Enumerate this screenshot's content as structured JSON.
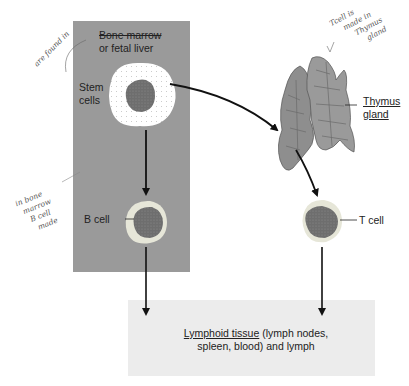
{
  "diagram": {
    "regions": {
      "marrow": {
        "label_line1": "Bone marrow",
        "label_line2": "or fetal liver"
      },
      "lymphoid": {
        "label_underlined": "Lymphoid tissue",
        "label_rest": " (lymph nodes,",
        "label_line2": "spleen, blood) and lymph"
      }
    },
    "labels": {
      "stem_line1": "Stem",
      "stem_line2": "cells",
      "b_cell": "B cell",
      "t_cell": "T cell",
      "thymus_line1": "Thymus",
      "thymus_line2": "gland"
    },
    "annotations": {
      "found_in": "are found in",
      "bone_marrow_note": [
        "in bone",
        "marrow",
        "B cell",
        "made"
      ],
      "thymus_note": [
        "Tcell is",
        "made in",
        "Thymus",
        "gland"
      ]
    },
    "colors": {
      "marrow_bg": "#9a9a9a",
      "lymph_bg": "#ececec",
      "nucleus": "#6e6e6e",
      "thymus": "#8e8e8e",
      "arrow": "#111111"
    }
  }
}
